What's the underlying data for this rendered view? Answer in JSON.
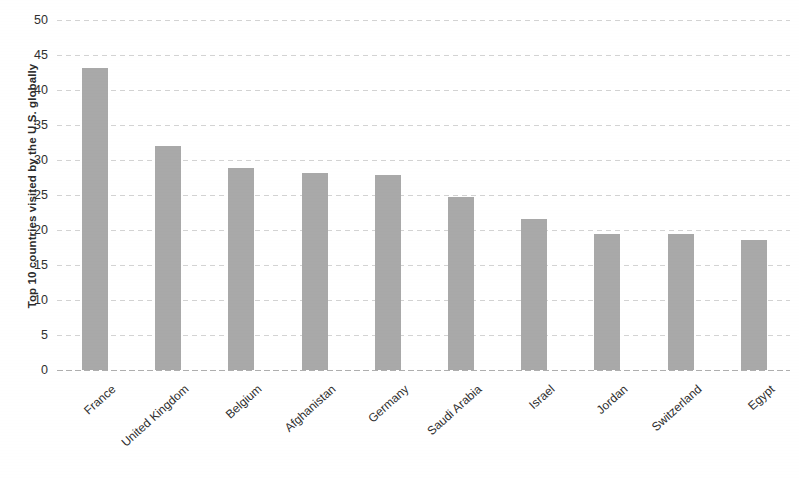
{
  "chart_data": {
    "type": "bar",
    "title": "",
    "xlabel": "",
    "ylabel": "Top 10 countries visited by the U.S. globally",
    "ylim": [
      0,
      50
    ],
    "yticks": [
      0,
      5,
      10,
      15,
      20,
      25,
      30,
      35,
      40,
      45,
      50
    ],
    "ytick_labels": [
      "0",
      "5",
      "10",
      "15",
      "20",
      "25",
      "30",
      "35",
      "40",
      "45",
      "50"
    ],
    "grid": true,
    "legend": null,
    "bar_color": "#a9a9a9",
    "categories": [
      "France",
      "United Kingdom",
      "Belgium",
      "Afghanistan",
      "Germany",
      "Saudi Arabia",
      "Israel",
      "Jordan",
      "Switzerland",
      "Egypt"
    ],
    "values": [
      43.1,
      32.0,
      28.9,
      28.1,
      27.9,
      24.7,
      21.6,
      19.5,
      19.5,
      18.6
    ]
  }
}
